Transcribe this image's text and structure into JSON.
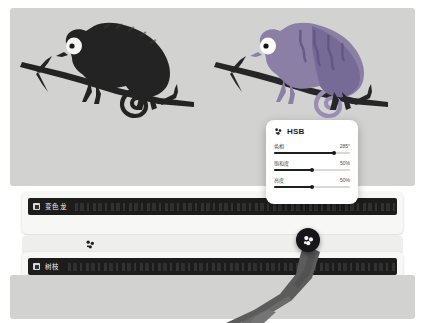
{
  "app": {
    "background_color": "#ffffff",
    "canvas_color": "#d2d3d1"
  },
  "artwork": {
    "left": {
      "name": "chameleon-on-branch-dark",
      "body_color": "#232323",
      "branch_color": "#232323",
      "eye_color": "#f4f4f2",
      "pupil_color": "#1a1a1a"
    },
    "right": {
      "name": "chameleon-on-branch-purple",
      "body_color": "#8b7fa6",
      "body_shade_color": "#6f6490",
      "tail_color": "#9a8fb3",
      "branch_color": "#262626",
      "eye_color": "#fbfbf8",
      "pupil_color": "#141414"
    }
  },
  "hsb_panel": {
    "icon": "palette-icon",
    "title": "HSB",
    "sliders": [
      {
        "label": "色相",
        "value": "285°",
        "percent": 79,
        "name": "hue-slider"
      },
      {
        "label": "饱和度",
        "value": "50%",
        "percent": 50,
        "name": "saturation-slider"
      },
      {
        "label": "亮度",
        "value": "50%",
        "percent": 50,
        "name": "brightness-slider"
      }
    ]
  },
  "layers": [
    {
      "name": "layer-chameleon",
      "title": "变色龙",
      "checked": true,
      "checkbox_label": "visibility-checkbox"
    },
    {
      "name": "layer-branch",
      "title": "树枝",
      "checked": true,
      "checkbox_label": "visibility-checkbox"
    }
  ],
  "middle_strip": {
    "name": "color-strip",
    "icon": "palette-icon"
  },
  "drag_handle": {
    "name": "color-drag-handle",
    "icon": "palette-icon",
    "color": "#15151a"
  }
}
